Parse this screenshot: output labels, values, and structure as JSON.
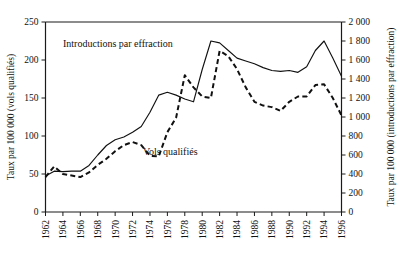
{
  "chart_data": {
    "type": "line",
    "title": "",
    "xlabel": "",
    "ylabel": "Taux par 100 000 (vols qualifiés)",
    "y2label": "Taux par 100 000 (introductions par effraction)",
    "grid": false,
    "legend_position": "inline-annotations",
    "xlim": [
      1962,
      1996
    ],
    "ylim": [
      0,
      250
    ],
    "y2lim": [
      0,
      2000
    ],
    "xticks": [
      1962,
      1964,
      1966,
      1968,
      1970,
      1972,
      1974,
      1976,
      1978,
      1980,
      1982,
      1984,
      1986,
      1988,
      1990,
      1992,
      1994,
      1996
    ],
    "xticklabels": [
      "1962",
      "1964",
      "1966",
      "1968",
      "1970",
      "1972",
      "1974",
      "1976",
      "1978",
      "1980",
      "1982",
      "1984",
      "1986",
      "1988",
      "1990",
      "1992",
      "1994",
      "1996"
    ],
    "yticks": [
      0,
      50,
      100,
      150,
      200,
      250
    ],
    "yticklabels": [
      "0",
      "50",
      "100",
      "150",
      "200",
      "250"
    ],
    "y2ticks": [
      0,
      200,
      400,
      600,
      800,
      1000,
      1200,
      1400,
      1600,
      1800,
      2000
    ],
    "y2ticklabels": [
      "0",
      "200",
      "400",
      "600",
      "800",
      "1 000",
      "1 200",
      "1 400",
      "1 600",
      "1 800",
      "2 000"
    ],
    "x": [
      1962,
      1963,
      1964,
      1965,
      1966,
      1967,
      1968,
      1969,
      1970,
      1971,
      1972,
      1973,
      1974,
      1975,
      1976,
      1977,
      1978,
      1979,
      1980,
      1981,
      1982,
      1983,
      1984,
      1985,
      1986,
      1987,
      1988,
      1989,
      1990,
      1991,
      1992,
      1993,
      1994,
      1995,
      1996
    ],
    "series": [
      {
        "name": "Introductions par effraction",
        "axis": "right",
        "style": "solid",
        "annotation": "Introductions par effraction",
        "values": [
          380,
          430,
          425,
          430,
          430,
          490,
          600,
          700,
          760,
          790,
          840,
          900,
          1050,
          1230,
          1260,
          1230,
          1190,
          1160,
          1500,
          1800,
          1780,
          1700,
          1620,
          1590,
          1560,
          1520,
          1490,
          1480,
          1490,
          1470,
          1530,
          1700,
          1800,
          1620,
          1430
        ]
      },
      {
        "name": "Vols qualifiés",
        "axis": "left",
        "style": "dashed",
        "annotation": "Vols qualifiés",
        "values": [
          46,
          60,
          50,
          48,
          46,
          52,
          62,
          70,
          80,
          88,
          92,
          88,
          74,
          73,
          105,
          124,
          180,
          164,
          152,
          150,
          212,
          205,
          188,
          164,
          145,
          140,
          138,
          133,
          145,
          152,
          152,
          167,
          168,
          150,
          127
        ]
      }
    ]
  }
}
